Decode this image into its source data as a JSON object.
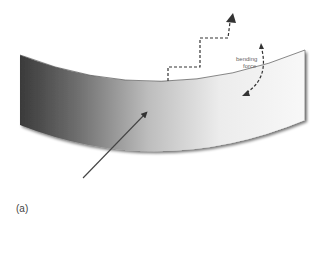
{
  "figure": {
    "panel_label": "(a)",
    "annotations": {
      "bending_force_line1": "bending",
      "bending_force_line2": "force"
    },
    "colors": {
      "beam_dark": "#3a3a3a",
      "beam_mid": "#9a9a9a",
      "beam_light": "#f4f4f4",
      "arrow": "#444444",
      "dashed": "#333333"
    },
    "elements": [
      {
        "name": "curved-beam",
        "description": "gradient shaded bent plate/beam"
      },
      {
        "name": "pointer-arrow",
        "description": "solid arrow pointing to beam face"
      },
      {
        "name": "stepped-dashed-arrow",
        "description": "dashed staircase path pointing upward"
      },
      {
        "name": "curved-dashed-arrow",
        "description": "curved dashed arrow indicating bending force"
      }
    ]
  }
}
